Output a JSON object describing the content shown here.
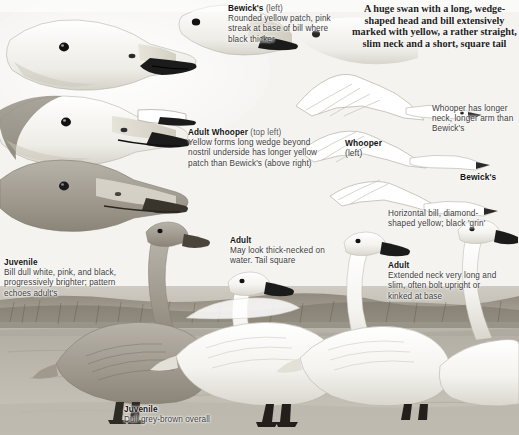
{
  "plate": {
    "title": "Swan identification plate",
    "palette": {
      "paper": "#f2f1ee",
      "ink": "#2b2b2b",
      "heading": "#111111",
      "sub": "#555555",
      "water": "#b9b5ab",
      "reed": "#8b8578",
      "bill_black": "#1a1a1a",
      "bill_yellow": "#d8d5cc",
      "juvenile_grey": "#9a958c"
    },
    "captions": {
      "bewick_top": {
        "heading": "Bewick's",
        "sub": "(left)",
        "body": "Rounded yellow patch, pink streak at base of bill where black thicker"
      },
      "intro": "A huge swan with a long, wedge-shaped head and bill extensively marked with yellow, a rather straight, slim neck and a short, square tail",
      "whooper_head": {
        "heading": "Adult Whooper",
        "sub": "(top left)",
        "body": "Yellow forms long wedge beyond nostril underside has longer yellow patch than Bewick's (above right)"
      },
      "whooper_flight": {
        "heading": "Whooper",
        "sub": "(left)"
      },
      "whooper_neck": {
        "body": "Whooper has longer neck, longer arm than Bewick's"
      },
      "bewick_flight": {
        "heading": "Bewick's"
      },
      "horizontal_bill": {
        "body": "Horizontal bill, diamond-shaped yellow; black 'grin'"
      },
      "juvenile_head": {
        "heading": "Juvenile",
        "body": "Bill dull white, pink, and black, progressively brighter; pattern echoes adult's"
      },
      "adult_water": {
        "heading": "Adult",
        "body": "May look thick-necked on water. Tail square"
      },
      "adult_neck": {
        "heading": "Adult",
        "body": "Extended neck very long and slim, often bolt upright or kinked at base"
      },
      "juvenile_bottom": {
        "heading": "Juvenile",
        "body": "Dull grey-brown overall"
      }
    }
  }
}
